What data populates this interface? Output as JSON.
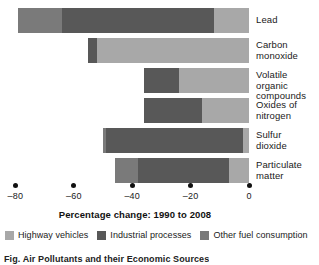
{
  "chart_data": {
    "type": "bar",
    "orientation": "horizontal",
    "stacked": true,
    "title": "",
    "xlabel": "Percentage change: 1990 to 2008",
    "ylabel": "",
    "xlim": [
      -85,
      2
    ],
    "xticks": [
      -80,
      -60,
      -40,
      -20,
      0
    ],
    "xticklabels": [
      "–80",
      "–60",
      "–40",
      "–20",
      "0"
    ],
    "grid": false,
    "legend_position": "bottom",
    "categories": [
      "Lead",
      "Carbon monoxide",
      "Volatile organic compounds",
      "Oxides of nitrogen",
      "Sulfur dioxide",
      "Particulate matter"
    ],
    "category_label_lines": [
      "Lead",
      "Carbon\nmonoxide",
      "Volatile organic\ncompounds",
      "Oxides of\nnitrogen",
      "Sulfur\ndioxide",
      "Particulate\nmatter"
    ],
    "series": [
      {
        "name": "Highway vehicles",
        "color": "#a8a8a8",
        "values": [
          -12,
          -52,
          -24,
          -16,
          -2,
          -7
        ]
      },
      {
        "name": "Industrial processes",
        "color": "#585858",
        "values": [
          -52,
          -3,
          -12,
          -20,
          -47,
          -31
        ]
      },
      {
        "name": "Other fuel consumption",
        "color": "#7a7a7a",
        "values": [
          -15,
          0,
          0,
          0,
          -1,
          -8
        ]
      }
    ],
    "totals": [
      -79,
      -55,
      -36,
      -36,
      -50,
      -46
    ]
  },
  "legend": {
    "items": [
      {
        "label": "Highway vehicles",
        "color": "#a8a8a8"
      },
      {
        "label": "Industrial processes",
        "color": "#585858"
      },
      {
        "label": "Other fuel consumption",
        "color": "#7a7a7a"
      }
    ]
  },
  "caption": {
    "text": "Fig. Air Pollutants and their Economic Sources"
  }
}
